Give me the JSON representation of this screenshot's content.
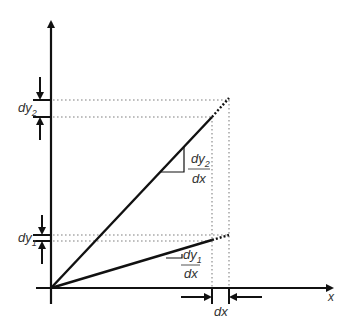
{
  "diagram": {
    "axes": {
      "x_label": "x"
    },
    "labels": {
      "dy2": "dy",
      "dy2_sub": "2",
      "dy1": "dy",
      "dy1_sub": "1",
      "dx": "dx",
      "slope2_num": "dy",
      "slope2_num_sub": "2",
      "slope2_den": "dx",
      "slope1_num": "dy",
      "slope1_num_sub": "1",
      "slope1_den": "dx"
    },
    "colors": {
      "line": "#111111",
      "dotted": "#aaaaaa",
      "text": "#333333"
    }
  }
}
